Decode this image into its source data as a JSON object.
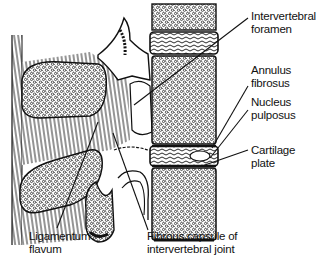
{
  "diagram": {
    "colors": {
      "ink": "#111111",
      "background": "#ffffff"
    },
    "labels": [
      {
        "id": "intervertebral-foramen",
        "lines": [
          "Intervertebral",
          "foramen"
        ]
      },
      {
        "id": "annulus-fibrosus",
        "lines": [
          "Annulus",
          "fibrosus"
        ]
      },
      {
        "id": "nucleus-pulposus",
        "lines": [
          "Nucleus",
          "pulposus"
        ]
      },
      {
        "id": "cartilage-plate",
        "lines": [
          "Cartilage plate"
        ]
      },
      {
        "id": "ligamentum-flavum",
        "lines": [
          "Ligamentum",
          "flavum"
        ]
      },
      {
        "id": "fibrous-capsule",
        "lines": [
          "Fibrous capsule of",
          "intervertebral joint"
        ]
      }
    ]
  }
}
